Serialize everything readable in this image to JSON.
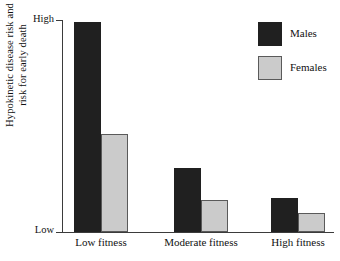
{
  "chart_data": {
    "type": "bar",
    "title": "",
    "xlabel": "",
    "ylabel": "Hypokinetic disease risk and risk for early death",
    "ylabel_lines": [
      "Hypokinetic disease risk and",
      "risk for early death"
    ],
    "categories": [
      "Low fitness",
      "Moderate fitness",
      "High fitness"
    ],
    "ytick_labels": [
      "High",
      "Low"
    ],
    "ylim": [
      0,
      100
    ],
    "y_axis_qualitative": true,
    "grid": false,
    "legend_position": "top-right",
    "series": [
      {
        "name": "Males",
        "color": "#202020",
        "values": [
          99,
          30,
          16
        ]
      },
      {
        "name": "Females",
        "color": "#cbcbcb",
        "values": [
          46,
          15,
          9
        ]
      }
    ]
  },
  "legend": {
    "items": [
      {
        "label": "Males",
        "swatch": "male"
      },
      {
        "label": "Females",
        "swatch": "female"
      }
    ]
  },
  "axis": {
    "high_label": "High",
    "low_label": "Low"
  }
}
